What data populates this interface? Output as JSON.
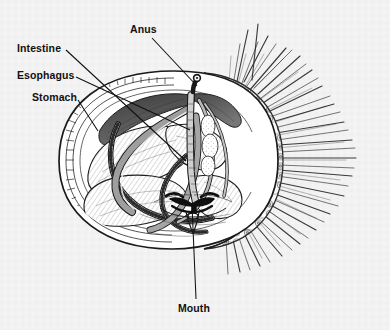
{
  "figure": {
    "caption": "",
    "background_color": "#f2f2f2",
    "ink_color": "#1a1a1a",
    "shade_dark": "#4a4a4a",
    "shade_mid": "#9a9a9a",
    "shade_light": "#d6d6d6"
  },
  "labels": [
    {
      "id": "anus",
      "text": "Anus",
      "leader": {
        "from_x": 152,
        "from_y": 38,
        "to_x": 197,
        "to_y": 86
      }
    },
    {
      "id": "intestine",
      "text": "Intestine",
      "leader": {
        "from_x": 66,
        "from_y": 50,
        "to_x": 186,
        "to_y": 161
      }
    },
    {
      "id": "esophagus",
      "text": "Esophagus",
      "leader": {
        "from_x": 76,
        "from_y": 77,
        "to_x": 190,
        "to_y": 130
      }
    },
    {
      "id": "stomach",
      "text": "Stomach",
      "leader": {
        "from_x": 78,
        "from_y": 100,
        "to_x": 98,
        "to_y": 131
      }
    },
    {
      "id": "mouth",
      "text": "Mouth",
      "leader": {
        "from_x": 196,
        "from_y": 299,
        "to_x": 192,
        "to_y": 205
      }
    }
  ],
  "anatomy_parts": [
    "test-shell-with-tubercles",
    "spines",
    "esophagus",
    "stomach",
    "intestine",
    "rectum",
    "anus",
    "aristotles-lantern",
    "mouth",
    "gonad",
    "ampullae",
    "tube-feet"
  ]
}
